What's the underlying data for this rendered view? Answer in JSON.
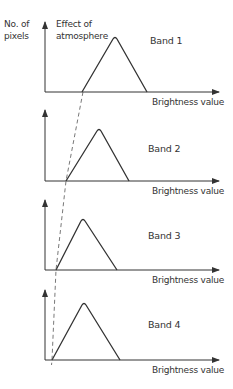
{
  "y_axis_label": [
    "No. of",
    "pixels"
  ],
  "annotation": [
    "Effect of",
    "atmosphere"
  ],
  "x_axis_label": "Brightness value",
  "colors": {
    "ink": "#333333",
    "background": "#ffffff"
  },
  "panels": [
    {
      "band": "Band 1",
      "axis_top": 22,
      "axis_y": 92,
      "tri": [
        82,
        115,
        37,
        147
      ]
    },
    {
      "band": "Band 2",
      "axis_top": 110,
      "axis_y": 181,
      "tri": [
        66,
        99,
        129,
        129
      ]
    },
    {
      "band": "Band 3",
      "axis_top": 200,
      "axis_y": 270,
      "tri": [
        56,
        83,
        219,
        117
      ]
    },
    {
      "band": "Band 4",
      "axis_top": 290,
      "axis_y": 360,
      "tri": [
        52,
        84,
        303,
        120
      ]
    }
  ],
  "dashed_line": [
    [
      83,
      92
    ],
    [
      66,
      181
    ],
    [
      56,
      270
    ],
    [
      52,
      360
    ]
  ]
}
